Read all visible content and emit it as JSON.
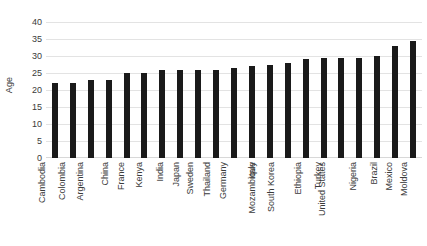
{
  "chart_data": {
    "type": "bar",
    "title": "",
    "xlabel": "",
    "ylabel": "Age",
    "ylim": [
      0,
      40
    ],
    "yticks": [
      0,
      5,
      10,
      15,
      20,
      25,
      30,
      35,
      40
    ],
    "grid": true,
    "legend": false,
    "bar_color": "#1a1a1a",
    "gridline_color": "#e3e3e3",
    "categories": [
      "Cambodia",
      "Colombia",
      "Argentina",
      "China",
      "France",
      "Kenya",
      "India",
      "Japan",
      "Sweden",
      "Thailand",
      "Germany",
      "Italy",
      "Mozambique",
      "South Korea",
      "Ethiopia",
      "Turkey",
      "United States",
      "Nigeria",
      "Brazil",
      "Mexico",
      "Moldova"
    ],
    "values": [
      22,
      22,
      23,
      23,
      25,
      25,
      26,
      26,
      26,
      26,
      26.5,
      27,
      27.5,
      28,
      29,
      29.5,
      29.5,
      29.5,
      30,
      33,
      34.5
    ]
  }
}
